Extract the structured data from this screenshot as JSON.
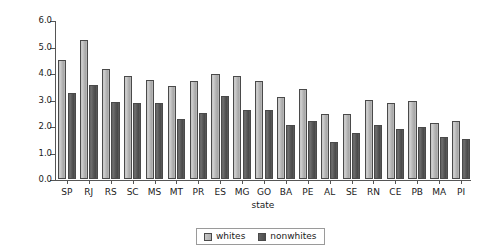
{
  "chart_data": {
    "type": "bar",
    "title": "",
    "xlabel": "state",
    "ylabel": "years of school",
    "ylim": [
      0.0,
      6.0
    ],
    "yticks": [
      "0.0",
      "1.0",
      "2.0",
      "3.0",
      "4.0",
      "5.0",
      "6.0"
    ],
    "grid": false,
    "legend_position": "bottom-center",
    "categories": [
      "SP",
      "RJ",
      "RS",
      "SC",
      "MS",
      "MT",
      "PR",
      "ES",
      "MG",
      "GO",
      "BA",
      "PE",
      "AL",
      "SE",
      "RN",
      "CE",
      "PB",
      "MA",
      "PI"
    ],
    "series": [
      {
        "name": "whites",
        "color": "#bdbdbd",
        "values": [
          4.5,
          5.25,
          4.15,
          3.9,
          3.75,
          3.5,
          3.7,
          3.95,
          3.9,
          3.7,
          3.1,
          3.4,
          2.45,
          2.45,
          3.0,
          2.85,
          2.95,
          2.1,
          2.2
        ]
      },
      {
        "name": "nonwhites",
        "color": "#555555",
        "values": [
          3.25,
          3.55,
          2.9,
          2.85,
          2.85,
          2.25,
          2.5,
          3.15,
          2.6,
          2.6,
          2.05,
          2.2,
          1.4,
          1.75,
          2.05,
          1.9,
          1.95,
          1.6,
          1.5
        ]
      }
    ]
  },
  "legend": {
    "entries": [
      {
        "label": "whites",
        "swatch": "whites"
      },
      {
        "label": "nonwhites",
        "swatch": "nonwhites"
      }
    ]
  }
}
